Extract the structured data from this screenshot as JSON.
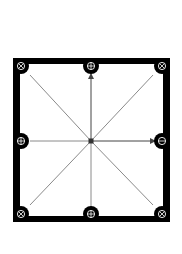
{
  "diagram": {
    "title": "",
    "frame": {
      "x": 13,
      "y": 58,
      "width": 157,
      "height": 164,
      "border_color": "#000000",
      "border_width": 7,
      "fill": "#ffffff"
    },
    "center": {
      "x": 91,
      "y": 141,
      "color": "#333333"
    },
    "line_color": "#8a8a8a",
    "arrow_color": "#444444",
    "nodes": [
      {
        "id": "top-left",
        "x": 21,
        "y": 66,
        "symbol": "circle-x",
        "glyph": "⊗"
      },
      {
        "id": "top-center",
        "x": 91,
        "y": 66,
        "symbol": "circle-plus",
        "glyph": "⊕"
      },
      {
        "id": "top-right",
        "x": 162,
        "y": 66,
        "symbol": "circle-x",
        "glyph": "⊗"
      },
      {
        "id": "middle-left",
        "x": 21,
        "y": 141,
        "symbol": "circle-plus",
        "glyph": "⊕"
      },
      {
        "id": "middle-right",
        "x": 162,
        "y": 141,
        "symbol": "circle-minus",
        "glyph": "⊖"
      },
      {
        "id": "bottom-left",
        "x": 21,
        "y": 214,
        "symbol": "circle-x",
        "glyph": "⊗"
      },
      {
        "id": "bottom-center",
        "x": 91,
        "y": 214,
        "symbol": "circle-plus",
        "glyph": "⊕"
      },
      {
        "id": "bottom-right",
        "x": 162,
        "y": 214,
        "symbol": "circle-x",
        "glyph": "⊗"
      }
    ],
    "connections": [
      {
        "from": "center",
        "to": "top-left",
        "x1": 91,
        "y1": 141,
        "x2": 30,
        "y2": 75,
        "arrow": false
      },
      {
        "from": "center",
        "to": "top-right",
        "x1": 91,
        "y1": 141,
        "x2": 153,
        "y2": 75,
        "arrow": false
      },
      {
        "from": "center",
        "to": "bottom-left",
        "x1": 91,
        "y1": 141,
        "x2": 30,
        "y2": 205,
        "arrow": false
      },
      {
        "from": "center",
        "to": "bottom-right",
        "x1": 91,
        "y1": 141,
        "x2": 153,
        "y2": 205,
        "arrow": false
      },
      {
        "from": "center",
        "to": "top-center",
        "x1": 91,
        "y1": 141,
        "x2": 91,
        "y2": 74,
        "arrow": true
      },
      {
        "from": "center",
        "to": "middle-right",
        "x1": 91,
        "y1": 141,
        "x2": 155,
        "y2": 141,
        "arrow": true
      },
      {
        "from": "middle-left",
        "to": "center",
        "x1": 30,
        "y1": 141,
        "x2": 91,
        "y2": 141,
        "arrow": false
      },
      {
        "from": "bottom-center",
        "to": "center",
        "x1": 91,
        "y1": 207,
        "x2": 91,
        "y2": 141,
        "arrow": false
      }
    ]
  }
}
